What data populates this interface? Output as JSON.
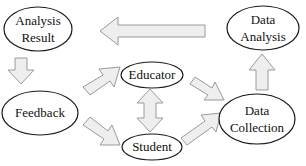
{
  "diagram": {
    "type": "flow-cycle",
    "colors": {
      "node_fill": "#ffffff",
      "node_stroke": "#1a1a1a",
      "arrow_fill": "#eeeeee",
      "arrow_stroke": "#9a9a9a",
      "text": "#111111"
    },
    "nodes": {
      "analysis_result": {
        "line1": "Analysis",
        "line2": "Result"
      },
      "data_analysis": {
        "line1": "Data",
        "line2": "Analysis"
      },
      "educator": {
        "label": "Educator"
      },
      "feedback": {
        "label": "Feedback"
      },
      "student": {
        "label": "Student"
      },
      "data_collection": {
        "line1": "Data",
        "line2": "Collection"
      }
    },
    "edges": [
      {
        "from": "Data Analysis",
        "to": "Analysis Result"
      },
      {
        "from": "Analysis Result",
        "to": "Feedback"
      },
      {
        "from": "Feedback",
        "to": "Educator"
      },
      {
        "from": "Feedback",
        "to": "Student"
      },
      {
        "from": "Educator",
        "to": "Student",
        "bidirectional": true
      },
      {
        "from": "Educator",
        "to": "Data Collection"
      },
      {
        "from": "Student",
        "to": "Data Collection"
      },
      {
        "from": "Data Collection",
        "to": "Data Analysis"
      }
    ]
  }
}
